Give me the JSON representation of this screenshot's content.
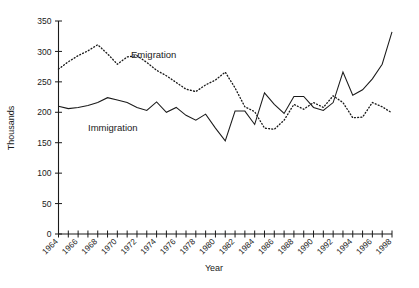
{
  "chart_data": {
    "type": "line",
    "title": "",
    "xlabel": "Year",
    "ylabel": "Thousands",
    "ylim": [
      0,
      350
    ],
    "ytick_values": [
      0,
      50,
      100,
      150,
      200,
      250,
      300,
      350
    ],
    "ytick_labels": [
      "0",
      "50",
      "100",
      "150",
      "200",
      "250",
      "300",
      "350"
    ],
    "xlim": [
      1964,
      1998
    ],
    "grid": false,
    "legend_position": "inline-annotations",
    "x": [
      1964,
      1965,
      1966,
      1967,
      1968,
      1969,
      1970,
      1971,
      1972,
      1973,
      1974,
      1975,
      1976,
      1977,
      1978,
      1979,
      1980,
      1981,
      1982,
      1983,
      1984,
      1985,
      1986,
      1987,
      1988,
      1989,
      1990,
      1991,
      1992,
      1993,
      1994,
      1995,
      1996,
      1997,
      1998
    ],
    "xtick_labels": [
      "1964",
      "",
      "1966",
      "",
      "1968",
      "",
      "1970",
      "",
      "1972",
      "",
      "1974",
      "",
      "1976",
      "",
      "1978",
      "",
      "1980",
      "",
      "1982",
      "",
      "1984",
      "",
      "1986",
      "",
      "1988",
      "",
      "1990",
      "",
      "1992",
      "",
      "1994",
      "",
      "1996",
      "",
      "1998"
    ],
    "xtick_labels_shown": [
      "1964",
      "1966",
      "1968",
      "1970",
      "1972",
      "1974",
      "1976",
      "1978",
      "1980",
      "1982",
      "1984",
      "1986",
      "1988",
      "1990",
      "1992",
      "1994",
      "1996",
      "1998"
    ],
    "series": [
      {
        "name": "Emigration",
        "style": "dotted",
        "label_text": "Emigration",
        "values": [
          271,
          283,
          293,
          301,
          311,
          296,
          279,
          291,
          293,
          282,
          269,
          260,
          249,
          238,
          234,
          245,
          253,
          266,
          240,
          209,
          201,
          174,
          172,
          187,
          213,
          205,
          216,
          208,
          227,
          216,
          191,
          192,
          216,
          209,
          199
        ]
      },
      {
        "name": "Immigration",
        "style": "solid",
        "label_text": "Immigration",
        "values": [
          210,
          206,
          208,
          211,
          216,
          224,
          220,
          216,
          208,
          203,
          217,
          200,
          208,
          195,
          187,
          197,
          174,
          153,
          202,
          202,
          180,
          232,
          213,
          198,
          226,
          226,
          208,
          203,
          216,
          266,
          228,
          237,
          255,
          279,
          332
        ]
      }
    ]
  },
  "annotations": {
    "emigration_label": "Emigration",
    "immigration_label": "Immigration"
  }
}
